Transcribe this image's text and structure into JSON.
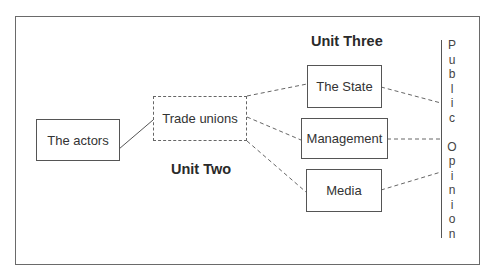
{
  "diagram": {
    "nodes": {
      "actors": "The actors",
      "trade_unions": "Trade unions",
      "state": "The State",
      "management": "Management",
      "media": "Media"
    },
    "headings": {
      "unit_two": "Unit Two",
      "unit_three": "Unit Three"
    },
    "side_label": {
      "word1": [
        "P",
        "u",
        "b",
        "l",
        "i",
        "c"
      ],
      "word2": [
        "O",
        "p",
        "i",
        "n",
        "i",
        "o",
        "n"
      ],
      "full": "Public Opinion"
    },
    "edges": [
      {
        "from": "actors",
        "to": "trade_unions",
        "style": "solid"
      },
      {
        "from": "trade_unions",
        "to": "state",
        "style": "dashed"
      },
      {
        "from": "trade_unions",
        "to": "management",
        "style": "dashed"
      },
      {
        "from": "trade_unions",
        "to": "media",
        "style": "dashed"
      },
      {
        "from": "state",
        "to": "public_opinion",
        "style": "dashed"
      },
      {
        "from": "management",
        "to": "public_opinion",
        "style": "dashed"
      },
      {
        "from": "media",
        "to": "public_opinion",
        "style": "dashed"
      }
    ],
    "colors": {
      "line": "#555555",
      "text": "#333333",
      "background": "#ffffff"
    }
  }
}
